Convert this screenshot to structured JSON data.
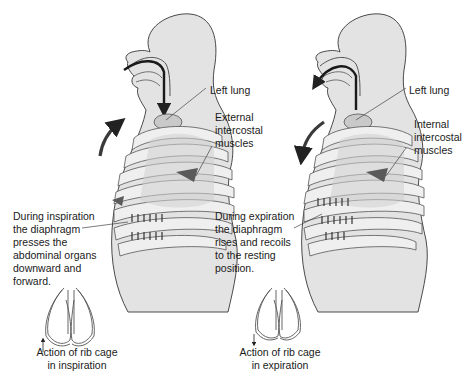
{
  "colors": {
    "body_fill": "#e3e3e3",
    "body_outline": "#4a4a4a",
    "rib_fill": "#efefef",
    "lung_fill": "#c9c9c9",
    "muscle_fill": "#5a5a5a",
    "arrow": "#3a3a3a",
    "text": "#1a1a1a"
  },
  "panels": [
    {
      "id": "inspiration",
      "labels": {
        "lung": "Left lung",
        "muscles": "External\nintercostal\nmuscles",
        "diaphragm": "During inspiration\nthe diaphragm\npresses the\nabdominal organs\ndownward and\nforward.",
        "rib_caption": "Action of rib cage\nin inspiration"
      },
      "airflow_direction": "in",
      "chest_motion_arrow": "up-forward"
    },
    {
      "id": "expiration",
      "labels": {
        "lung": "Left lung",
        "muscles": "Internal\nintercostal\nmuscles",
        "diaphragm": "During expiration\nthe diaphragm\nrises and recoils\nto the resting\nposition.",
        "rib_caption": "Action of rib cage\nin expiration"
      },
      "airflow_direction": "out",
      "chest_motion_arrow": "down-back"
    }
  ]
}
